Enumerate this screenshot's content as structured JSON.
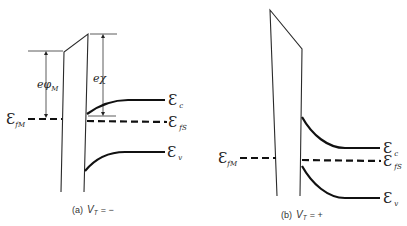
{
  "diagram": {
    "panel_a": {
      "caption_prefix": "(a)",
      "caption_var": "V",
      "caption_sub": "T",
      "caption_value": "= −",
      "labels": {
        "e_phi_m": {
          "main": "eφ",
          "sub": "M"
        },
        "e_chi": {
          "main": "eχ"
        },
        "e_fm": {
          "main": "Ɛ",
          "sub": "fM"
        },
        "e_c": {
          "main": "Ɛ",
          "sub": "c"
        },
        "e_fs": {
          "main": "Ɛ",
          "sub": "fS"
        },
        "e_v": {
          "main": "Ɛ",
          "sub": "v"
        }
      }
    },
    "panel_b": {
      "caption_prefix": "(b)",
      "caption_var": "V",
      "caption_sub": "T",
      "caption_value": "= +",
      "labels": {
        "e_fm": {
          "main": "Ɛ",
          "sub": "fM"
        },
        "e_c": {
          "main": "Ɛ",
          "sub": "c"
        },
        "e_fs": {
          "main": "Ɛ",
          "sub": "fS"
        },
        "e_v": {
          "main": "Ɛ",
          "sub": "v"
        }
      }
    }
  }
}
